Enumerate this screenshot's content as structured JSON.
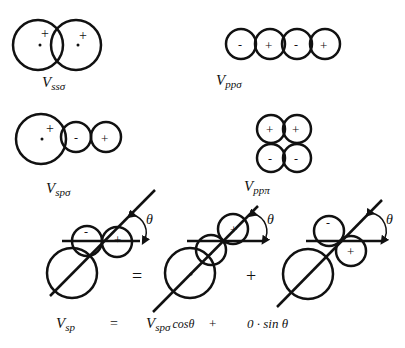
{
  "labels": {
    "vss_sigma": {
      "main": "V",
      "sub": "ssσ"
    },
    "vpp_sigma": {
      "main": "V",
      "sub": "ppσ"
    },
    "vsp_sigma": {
      "main": "V",
      "sub": "spσ"
    },
    "vpp_pi": {
      "main": "V",
      "sub": "ppπ"
    }
  },
  "signs": {
    "plus": "+",
    "minus": "-"
  },
  "angle_symbol": "θ",
  "equation": {
    "lhs_main": "V",
    "lhs_sub": "sp",
    "equals": "=",
    "term1_main": "V",
    "term1_sub": "spσ",
    "term1_func": "cosθ",
    "plus": "+",
    "term2": "0 · sin θ"
  },
  "diagram_operators": {
    "equals": "=",
    "plus": "+"
  }
}
